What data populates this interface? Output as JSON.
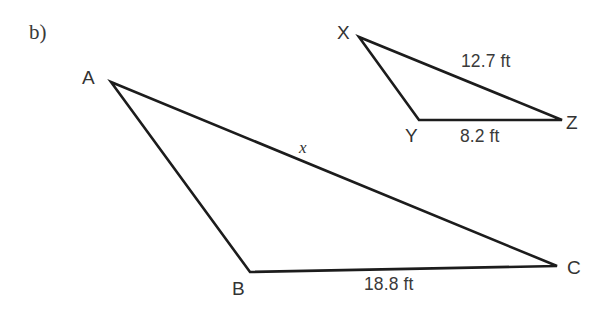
{
  "figure": {
    "part_label": "b)",
    "background_color": "#ffffff",
    "stroke_color": "#1c1c1c",
    "text_color": "#333333",
    "width": 608,
    "height": 309
  },
  "large_triangle": {
    "name": "triangle-abc",
    "vertices": [
      {
        "id": "A",
        "label": "A",
        "x": 111,
        "y": 82,
        "label_x": 82,
        "label_y": 68
      },
      {
        "id": "B",
        "label": "B",
        "x": 250,
        "y": 272,
        "label_x": 232,
        "label_y": 279
      },
      {
        "id": "C",
        "label": "C",
        "x": 557,
        "y": 266,
        "label_x": 567,
        "label_y": 258
      }
    ],
    "sides": [
      {
        "id": "AC",
        "label": "x",
        "label_x": 299,
        "label_y": 139,
        "unknown": true
      },
      {
        "id": "BC",
        "label": "18.8 ft",
        "label_x": 364,
        "label_y": 276,
        "unknown": false
      },
      {
        "id": "AB",
        "label": "",
        "label_x": 0,
        "label_y": 0,
        "unknown": false
      }
    ]
  },
  "small_triangle": {
    "name": "triangle-xyz",
    "vertices": [
      {
        "id": "X",
        "label": "X",
        "x": 359,
        "y": 37,
        "label_x": 337,
        "label_y": 23
      },
      {
        "id": "Y",
        "label": "Y",
        "x": 419,
        "y": 120,
        "label_x": 405,
        "label_y": 126
      },
      {
        "id": "Z",
        "label": "Z",
        "x": 562,
        "y": 120,
        "label_x": 566,
        "label_y": 113
      }
    ],
    "sides": [
      {
        "id": "XZ",
        "label": "12.7 ft",
        "label_x": 461,
        "label_y": 53,
        "unknown": false
      },
      {
        "id": "YZ",
        "label": "8.2 ft",
        "label_x": 460,
        "label_y": 128,
        "unknown": false
      },
      {
        "id": "XY",
        "label": "",
        "label_x": 0,
        "label_y": 0,
        "unknown": false
      }
    ]
  },
  "chart_data": {
    "type": "diagram",
    "shapes": [
      {
        "name": "triangle ABC",
        "points": [
          [
            111,
            82
          ],
          [
            250,
            272
          ],
          [
            557,
            266
          ]
        ],
        "labeled_sides": {
          "BC": "18.8 ft",
          "AC": "x"
        }
      },
      {
        "name": "triangle XYZ",
        "points": [
          [
            359,
            37
          ],
          [
            419,
            120
          ],
          [
            562,
            120
          ]
        ],
        "labeled_sides": {
          "XZ": "12.7 ft",
          "YZ": "8.2 ft"
        }
      }
    ]
  }
}
